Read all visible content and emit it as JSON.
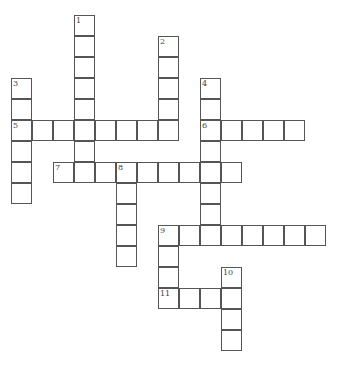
{
  "puzzle": {
    "title_fragment": "",
    "grid": {
      "origin_x": 11,
      "origin_y": 15,
      "cell_size": 21
    },
    "words": [
      {
        "number": 1,
        "direction": "down",
        "row": 0,
        "col": 3,
        "length": 8
      },
      {
        "number": 2,
        "direction": "down",
        "row": 1,
        "col": 7,
        "length": 5
      },
      {
        "number": 3,
        "direction": "down",
        "row": 3,
        "col": 0,
        "length": 6
      },
      {
        "number": 4,
        "direction": "down",
        "row": 3,
        "col": 9,
        "length": 8
      },
      {
        "number": 5,
        "direction": "across",
        "row": 5,
        "col": 0,
        "length": 8
      },
      {
        "number": 6,
        "direction": "across",
        "row": 5,
        "col": 9,
        "length": 5
      },
      {
        "number": 7,
        "direction": "across",
        "row": 7,
        "col": 2,
        "length": 9
      },
      {
        "number": 8,
        "direction": "down",
        "row": 7,
        "col": 5,
        "length": 5
      },
      {
        "number": 9,
        "direction": "across",
        "row": 10,
        "col": 7,
        "length": 8
      },
      {
        "number": 9,
        "direction": "down",
        "row": 10,
        "col": 7,
        "length": 4
      },
      {
        "number": 10,
        "direction": "down",
        "row": 12,
        "col": 10,
        "length": 4
      },
      {
        "number": 11,
        "direction": "across",
        "row": 13,
        "col": 7,
        "length": 4
      }
    ]
  }
}
